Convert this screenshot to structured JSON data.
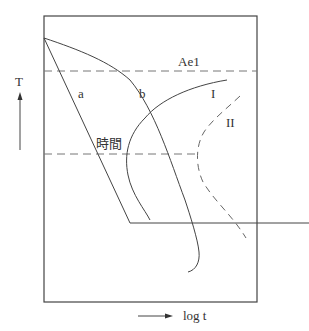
{
  "diagram": {
    "type": "TTT / CCT transformation diagram",
    "y_axis_label": "T",
    "x_axis_label": "log t",
    "reference_line_label": "Ae1",
    "curve_labels": {
      "a": "a",
      "b": "b",
      "region_I": "I",
      "region_II": "II",
      "time_label": "時間"
    },
    "colors": {
      "line": "#444444",
      "dashed": "#777777",
      "text": "#333333",
      "background": "#ffffff"
    }
  }
}
